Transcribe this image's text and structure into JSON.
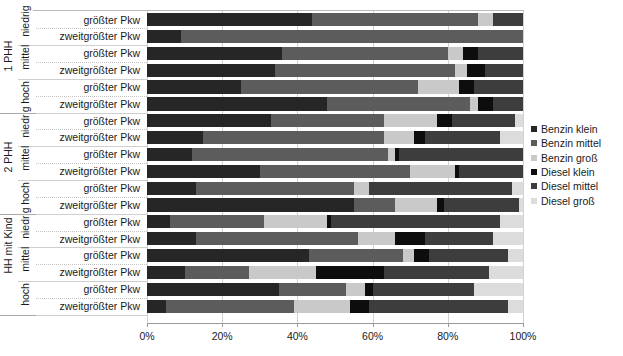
{
  "chart_data": {
    "type": "bar",
    "orientation": "horizontal",
    "stacked": true,
    "stack_mode": "percent",
    "title": "",
    "subtitle": "",
    "xlabel": "",
    "ylabel": "",
    "xlim": [
      0,
      100
    ],
    "xticks": [
      "0%",
      "20%",
      "40%",
      "60%",
      "80%",
      "100%"
    ],
    "xtick_values": [
      0,
      20,
      40,
      60,
      80,
      100
    ],
    "grid": true,
    "grid_axis": "x",
    "legend_position": "right",
    "legend": [
      {
        "label": "Benzin klein",
        "color": "#262626"
      },
      {
        "label": "Benzin mittel",
        "color": "#5c5c5c"
      },
      {
        "label": "Benzin groß",
        "color": "#c9c9c9"
      },
      {
        "label": "Diesel klein",
        "color": "#0d0d0d"
      },
      {
        "label": "Diesel mittel",
        "color": "#3d3d3d"
      },
      {
        "label": "Diesel groß",
        "color": "#dcdcdc"
      }
    ],
    "series": [
      {
        "name": "Benzin klein",
        "values": [
          44,
          9,
          36,
          34,
          25,
          48,
          33,
          15,
          12,
          30,
          13,
          55,
          6,
          13,
          43,
          10,
          35,
          5
        ]
      },
      {
        "name": "Benzin mittel",
        "values": [
          44,
          91,
          44,
          48,
          47,
          38,
          30,
          48,
          52,
          40,
          42,
          11,
          25,
          43,
          25,
          17,
          18,
          34
        ]
      },
      {
        "name": "Benzin groß",
        "values": [
          4,
          0,
          4,
          3,
          11,
          2,
          14,
          8,
          2,
          12,
          4,
          11,
          17,
          10,
          3,
          18,
          5,
          15
        ]
      },
      {
        "name": "Diesel klein",
        "values": [
          0,
          0,
          4,
          5,
          4,
          4,
          4,
          3,
          1,
          1,
          0,
          2,
          1,
          8,
          4,
          18,
          2,
          5
        ]
      },
      {
        "name": "Diesel mittel",
        "values": [
          8,
          0,
          12,
          10,
          13,
          8,
          17,
          20,
          33,
          17,
          38,
          20,
          45,
          18,
          21,
          28,
          27,
          37
        ]
      },
      {
        "name": "Diesel groß",
        "values": [
          0,
          0,
          0,
          0,
          0,
          0,
          2,
          6,
          0,
          0,
          3,
          1,
          6,
          8,
          4,
          9,
          13,
          4
        ]
      }
    ],
    "categories": [
      {
        "group": "1 PHH",
        "income": "niedrig",
        "rank": "größter Pkw"
      },
      {
        "group": "1 PHH",
        "income": "niedrig",
        "rank": "zweitgrößter Pkw"
      },
      {
        "group": "1 PHH",
        "income": "mittel",
        "rank": "größter Pkw"
      },
      {
        "group": "1 PHH",
        "income": "mittel",
        "rank": "zweitgrößter Pkw"
      },
      {
        "group": "1 PHH",
        "income": "hoch",
        "rank": "größter Pkw"
      },
      {
        "group": "1 PHH",
        "income": "hoch",
        "rank": "zweitgrößter Pkw"
      },
      {
        "group": "2 PHH",
        "income": "niedrig",
        "rank": "größter Pkw"
      },
      {
        "group": "2 PHH",
        "income": "niedrig",
        "rank": "zweitgrößter Pkw"
      },
      {
        "group": "2 PHH",
        "income": "mittel",
        "rank": "größter Pkw"
      },
      {
        "group": "2 PHH",
        "income": "mittel",
        "rank": "zweitgrößter Pkw"
      },
      {
        "group": "2 PHH",
        "income": "hoch",
        "rank": "größter Pkw"
      },
      {
        "group": "2 PHH",
        "income": "hoch",
        "rank": "zweitgrößter Pkw"
      },
      {
        "group": "HH mit Kind",
        "income": "niedrig",
        "rank": "größter Pkw"
      },
      {
        "group": "HH mit Kind",
        "income": "niedrig",
        "rank": "zweitgrößter Pkw"
      },
      {
        "group": "HH mit Kind",
        "income": "mittel",
        "rank": "größter Pkw"
      },
      {
        "group": "HH mit Kind",
        "income": "mittel",
        "rank": "zweitgrößter Pkw"
      },
      {
        "group": "HH mit Kind",
        "income": "hoch",
        "rank": "größter Pkw"
      },
      {
        "group": "HH mit Kind",
        "income": "hoch",
        "rank": "zweitgrößter Pkw"
      }
    ],
    "group_labels": [
      "1 PHH",
      "2 PHH",
      "HH mit Kind"
    ],
    "income_labels": [
      "niedrig",
      "mittel",
      "hoch"
    ],
    "rank_labels": [
      "größter Pkw",
      "zweitgrößter Pkw"
    ]
  }
}
